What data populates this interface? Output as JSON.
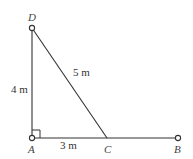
{
  "diagram": {
    "points": {
      "D": {
        "label": "D",
        "x": 32,
        "y": 28
      },
      "A": {
        "label": "A",
        "x": 32,
        "y": 138
      },
      "C": {
        "label": "C",
        "x": 107,
        "y": 138
      },
      "B": {
        "label": "B",
        "x": 178,
        "y": 138
      }
    },
    "lengths": {
      "AD": "4 m",
      "DC": "5 m",
      "AC": "3 m"
    },
    "right_angle_at": "A",
    "line_color": "#333333"
  }
}
